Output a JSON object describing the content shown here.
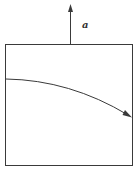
{
  "diagram": {
    "acceleration_label": "a",
    "colors": {
      "stroke": "#3a3a3a",
      "background": "#ffffff"
    },
    "box": {
      "x": 5,
      "y": 44,
      "width": 128,
      "height": 122
    },
    "vertical_arrow": {
      "x": 70,
      "y_start": 44,
      "y_end": 5,
      "direction": "up"
    },
    "trajectory": {
      "start": [
        5,
        79
      ],
      "control": [
        70,
        82
      ],
      "end": [
        131,
        117
      ],
      "direction": "right-down"
    }
  }
}
